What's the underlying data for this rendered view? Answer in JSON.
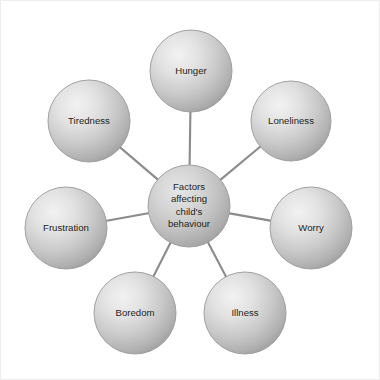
{
  "figure": {
    "type": "radial-spoke-diagram",
    "background_color": "#ffffff",
    "frame_border_color": "#ededed",
    "node_fill_light": "#ececec",
    "node_fill_dark": "#9e9e9e",
    "node_stroke_color": "#9a9a9a",
    "connector_color": "#8b8b8b",
    "label_color": "#231f20"
  },
  "hub": {
    "name": "central-node",
    "lines": [
      "Factors",
      "affecting",
      "child's",
      "behaviour"
    ],
    "full_text": "Factors affecting child's behaviour",
    "cx": 188,
    "cy": 205,
    "r": 41
  },
  "nodes": [
    {
      "id": "hunger",
      "label": "Hunger",
      "cx": 190,
      "cy": 70,
      "r": 41
    },
    {
      "id": "loneliness",
      "label": "Loneliness",
      "cx": 290,
      "cy": 120,
      "r": 40
    },
    {
      "id": "worry",
      "label": "Worry",
      "cx": 310,
      "cy": 227,
      "r": 41
    },
    {
      "id": "illness",
      "label": "Illness",
      "cx": 244,
      "cy": 312,
      "r": 41
    },
    {
      "id": "boredom",
      "label": "Boredom",
      "cx": 134,
      "cy": 312,
      "r": 41
    },
    {
      "id": "frustration",
      "label": "Frustration",
      "cx": 65,
      "cy": 227,
      "r": 41
    },
    {
      "id": "tiredness",
      "label": "Tiredness",
      "cx": 88,
      "cy": 120,
      "r": 41
    }
  ],
  "connectors": [
    {
      "id": "hub-to-hunger",
      "from": "hub",
      "to": "hunger"
    },
    {
      "id": "hub-to-loneliness",
      "from": "hub",
      "to": "loneliness"
    },
    {
      "id": "hub-to-worry",
      "from": "hub",
      "to": "worry"
    },
    {
      "id": "hub-to-illness",
      "from": "hub",
      "to": "illness"
    },
    {
      "id": "hub-to-boredom",
      "from": "hub",
      "to": "boredom"
    },
    {
      "id": "hub-to-frustration",
      "from": "hub",
      "to": "frustration"
    },
    {
      "id": "hub-to-tiredness",
      "from": "hub",
      "to": "tiredness"
    }
  ]
}
